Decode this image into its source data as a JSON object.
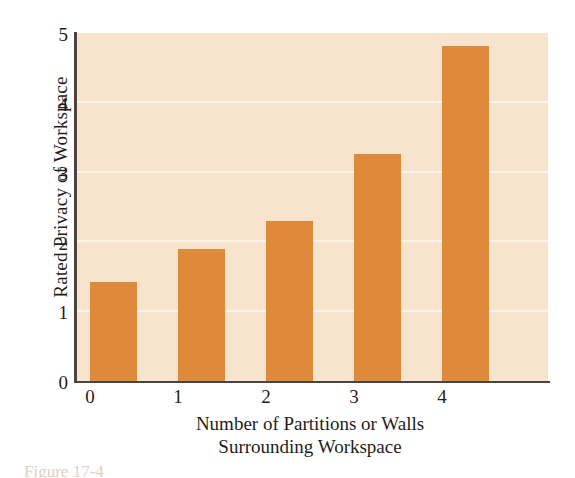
{
  "chart_data": {
    "type": "bar",
    "title": "",
    "xlabel": "Number of Partitions or Walls Surrounding Workspace",
    "xlabel_line1": "Number of Partitions or Walls",
    "xlabel_line2": "Surrounding Workspace",
    "ylabel": "Rated Privacy of Workspace",
    "categories": [
      "0",
      "1",
      "2",
      "3",
      "4"
    ],
    "values": [
      1.44,
      1.91,
      2.31,
      3.26,
      4.81
    ],
    "xticks": [
      "0",
      "1",
      "2",
      "3",
      "4"
    ],
    "yticks": [
      "0",
      "1",
      "2",
      "3",
      "4",
      "5"
    ],
    "ylim": [
      0,
      5
    ],
    "grid": "horizontal",
    "legend": "none",
    "colors": {
      "bar": "#dd8b3a",
      "plot_background": "#f8e3cd",
      "gridline": "#fdf3e8",
      "axis": "#4a4441",
      "text": "#1f1d1c",
      "page_background": "#ffffff"
    }
  },
  "caption": {
    "text": "Figure 17-4"
  }
}
